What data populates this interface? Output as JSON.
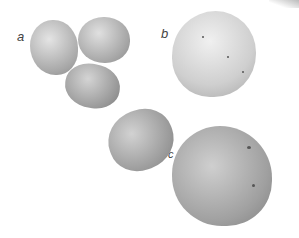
{
  "figure": {
    "labels": {
      "a": "a",
      "b": "b",
      "c": "c"
    },
    "colors": {
      "background": "#ffffff",
      "potato_light": "#d8d8d8",
      "potato_dark": "#8a8a8a",
      "label": "#444444"
    }
  }
}
